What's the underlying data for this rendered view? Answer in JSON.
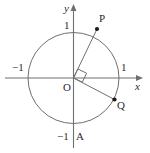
{
  "figure": {
    "width": 150,
    "height": 153,
    "background": "#ffffff",
    "stroke_color": "#6f6f6f",
    "text_color": "#2b2b2b",
    "point_color": "#1a1a1a"
  },
  "axes": {
    "x_label": "x",
    "y_label": "y",
    "origin_label": "O",
    "x_tick_positive": "1",
    "x_tick_negative": "−1",
    "y_tick_positive": "1",
    "y_tick_negative": "−1",
    "x_axis_y": 78,
    "y_axis_x": 73.5,
    "x_axis_start": 5,
    "x_axis_end": 143,
    "y_axis_start": 5,
    "y_axis_end": 148,
    "arrow_x": "right",
    "arrow_y": "up"
  },
  "circle": {
    "cx": 73.5,
    "cy": 78,
    "r": 45.5,
    "radius_value": 1
  },
  "points": [
    {
      "name": "P",
      "label": "P",
      "x": 97,
      "y": 29,
      "angle_deg": 65,
      "label_x": 101,
      "label_y": 15
    },
    {
      "name": "Q",
      "label": "Q",
      "x": 114.5,
      "y": 99.5,
      "angle_deg": -25,
      "label_x": 118,
      "label_y": 101
    },
    {
      "name": "A",
      "label": "A",
      "x": 73.5,
      "y": 123.5,
      "angle_deg": -90,
      "label_x": 76,
      "label_y": 133
    }
  ],
  "segments": [
    {
      "name": "radius-OP",
      "from": "O",
      "to": "P"
    },
    {
      "name": "radius-OQ",
      "from": "O",
      "to": "Q"
    }
  ],
  "right_angle": {
    "present": true,
    "at": "O",
    "between": "OP and OQ",
    "size": 9
  }
}
